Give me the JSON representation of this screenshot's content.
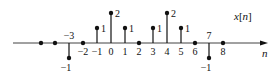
{
  "chart_data": {
    "type": "stem",
    "title": "",
    "signal_label": "x[n]",
    "xlabel": "n",
    "ylabel": "",
    "n": [
      -5,
      -4,
      -3,
      -2,
      -1,
      0,
      1,
      2,
      3,
      4,
      5,
      6,
      7,
      8
    ],
    "values": [
      0,
      0,
      -1,
      0,
      1,
      2,
      1,
      0,
      1,
      2,
      1,
      0,
      -1,
      0
    ],
    "tick_labels": [
      "-3",
      "-2",
      "-1",
      "0",
      "1",
      "2",
      "3",
      "4",
      "5",
      "6",
      "7",
      "8"
    ],
    "value_labels": [
      "-1",
      "1",
      "2",
      "1",
      "1",
      "2",
      "1",
      "-1"
    ],
    "ylim": [
      -1,
      2
    ],
    "grid": false,
    "legend": "none"
  },
  "layout": {
    "axis_y": 43,
    "x0": 111,
    "dx": 14,
    "dy": 15,
    "axis_start": 13,
    "axis_end": 268,
    "color": "#111111"
  }
}
